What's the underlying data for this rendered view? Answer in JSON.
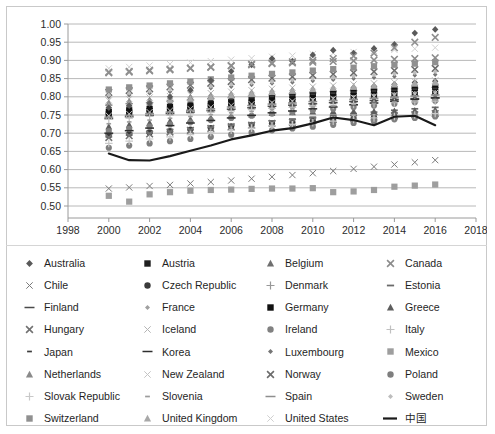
{
  "chart_data": {
    "type": "scatter",
    "title": "",
    "xlabel": "",
    "ylabel": "",
    "xlim": [
      1998,
      2018
    ],
    "ylim": [
      0.5,
      1.0
    ],
    "xticks": [
      "1998",
      "2000",
      "2002",
      "2004",
      "2006",
      "2008",
      "2010",
      "2012",
      "2014",
      "2016",
      "2018"
    ],
    "yticks": [
      "0.50",
      "0.55",
      "0.60",
      "0.65",
      "0.70",
      "0.75",
      "0.80",
      "0.85",
      "0.90",
      "0.95",
      "1.00"
    ],
    "grid": true,
    "legend_position": "bottom",
    "x": [
      2000,
      2001,
      2002,
      2003,
      2004,
      2005,
      2006,
      2007,
      2008,
      2009,
      2010,
      2011,
      2012,
      2013,
      2014,
      2015,
      2016
    ],
    "series": [
      {
        "name": "Australia",
        "marker": "diamond",
        "color": "#595959",
        "values": [
          0.755,
          0.762,
          0.768,
          0.772,
          0.778,
          0.783,
          0.789,
          0.793,
          0.8,
          0.806,
          0.812,
          0.818,
          0.824,
          0.829,
          0.834,
          0.839,
          0.843
        ]
      },
      {
        "name": "Austria",
        "marker": "square",
        "color": "#1f1f1f",
        "values": [
          0.752,
          0.757,
          0.761,
          0.765,
          0.77,
          0.774,
          0.779,
          0.783,
          0.788,
          0.792,
          0.795,
          0.799,
          0.802,
          0.805,
          0.808,
          0.81,
          0.812
        ]
      },
      {
        "name": "Belgium",
        "marker": "triangle",
        "color": "#6f6f6f",
        "values": [
          0.745,
          0.749,
          0.753,
          0.757,
          0.761,
          0.765,
          0.769,
          0.773,
          0.777,
          0.78,
          0.784,
          0.787,
          0.79,
          0.793,
          0.796,
          0.798,
          0.8
        ]
      },
      {
        "name": "Canada",
        "marker": "x",
        "color": "#8c8c8c",
        "values": [
          0.866,
          0.868,
          0.871,
          0.874,
          0.878,
          0.881,
          0.885,
          0.888,
          0.891,
          0.893,
          0.895,
          0.897,
          0.899,
          0.901,
          0.903,
          0.905,
          0.907
        ]
      },
      {
        "name": "Chile",
        "marker": "x-thin",
        "color": "#7a7a7a",
        "values": [
          0.548,
          0.551,
          0.555,
          0.558,
          0.562,
          0.566,
          0.57,
          0.575,
          0.58,
          0.585,
          0.59,
          0.596,
          0.602,
          0.608,
          0.614,
          0.62,
          0.626
        ]
      },
      {
        "name": "Czech Republic",
        "marker": "circle",
        "color": "#3a3a3a",
        "values": [
          0.694,
          0.698,
          0.702,
          0.706,
          0.71,
          0.714,
          0.719,
          0.723,
          0.727,
          0.73,
          0.734,
          0.737,
          0.74,
          0.743,
          0.746,
          0.748,
          0.75
        ]
      },
      {
        "name": "Denmark",
        "marker": "plus",
        "color": "#989898",
        "values": [
          0.777,
          0.781,
          0.784,
          0.788,
          0.791,
          0.795,
          0.798,
          0.802,
          0.805,
          0.808,
          0.811,
          0.814,
          0.817,
          0.819,
          0.822,
          0.824,
          0.826
        ]
      },
      {
        "name": "Estonia",
        "marker": "dash",
        "color": "#6a6a6a",
        "values": [
          0.69,
          0.695,
          0.7,
          0.705,
          0.71,
          0.716,
          0.722,
          0.728,
          0.734,
          0.739,
          0.744,
          0.749,
          0.754,
          0.758,
          0.763,
          0.767,
          0.771
        ]
      },
      {
        "name": "Finland",
        "marker": "dash-long",
        "color": "#4a4a4a",
        "values": [
          0.74,
          0.745,
          0.749,
          0.754,
          0.758,
          0.762,
          0.766,
          0.77,
          0.774,
          0.777,
          0.781,
          0.784,
          0.787,
          0.79,
          0.793,
          0.795,
          0.797
        ]
      },
      {
        "name": "France",
        "marker": "diamond-sm",
        "color": "#a0a0a0",
        "values": [
          0.762,
          0.766,
          0.77,
          0.773,
          0.777,
          0.781,
          0.784,
          0.788,
          0.791,
          0.794,
          0.797,
          0.8,
          0.803,
          0.805,
          0.808,
          0.81,
          0.812
        ]
      },
      {
        "name": "Germany",
        "marker": "square",
        "color": "#111111",
        "values": [
          0.758,
          0.763,
          0.767,
          0.772,
          0.776,
          0.781,
          0.786,
          0.791,
          0.796,
          0.8,
          0.805,
          0.809,
          0.813,
          0.817,
          0.821,
          0.824,
          0.827
        ]
      },
      {
        "name": "Greece",
        "marker": "triangle",
        "color": "#5d5d5d",
        "values": [
          0.718,
          0.723,
          0.728,
          0.733,
          0.738,
          0.742,
          0.747,
          0.751,
          0.755,
          0.757,
          0.759,
          0.76,
          0.76,
          0.76,
          0.761,
          0.762,
          0.764
        ]
      },
      {
        "name": "Hungary",
        "marker": "x",
        "color": "#727272",
        "values": [
          0.688,
          0.693,
          0.698,
          0.703,
          0.708,
          0.713,
          0.718,
          0.722,
          0.727,
          0.73,
          0.734,
          0.737,
          0.741,
          0.744,
          0.748,
          0.751,
          0.754
        ]
      },
      {
        "name": "Iceland",
        "marker": "x-thin",
        "color": "#b4b4b4",
        "values": [
          0.79,
          0.794,
          0.798,
          0.802,
          0.806,
          0.81,
          0.814,
          0.818,
          0.822,
          0.825,
          0.828,
          0.831,
          0.834,
          0.837,
          0.84,
          0.842,
          0.845
        ]
      },
      {
        "name": "Ireland",
        "marker": "circle",
        "color": "#818181",
        "values": [
          0.706,
          0.712,
          0.718,
          0.724,
          0.73,
          0.736,
          0.742,
          0.748,
          0.754,
          0.758,
          0.763,
          0.767,
          0.772,
          0.776,
          0.781,
          0.785,
          0.789
        ]
      },
      {
        "name": "Italy",
        "marker": "plus",
        "color": "#c0c0c0",
        "values": [
          0.738,
          0.742,
          0.746,
          0.75,
          0.754,
          0.757,
          0.761,
          0.765,
          0.768,
          0.771,
          0.774,
          0.776,
          0.779,
          0.781,
          0.784,
          0.786,
          0.788
        ]
      },
      {
        "name": "Japan",
        "marker": "dash-sm",
        "color": "#3d3d3d",
        "values": [
          0.77,
          0.774,
          0.778,
          0.782,
          0.786,
          0.79,
          0.794,
          0.798,
          0.801,
          0.804,
          0.807,
          0.81,
          0.813,
          0.816,
          0.818,
          0.821,
          0.823
        ]
      },
      {
        "name": "Korea",
        "marker": "dash-long",
        "color": "#2e2e2e",
        "values": [
          0.7,
          0.707,
          0.714,
          0.721,
          0.728,
          0.735,
          0.742,
          0.749,
          0.756,
          0.761,
          0.767,
          0.772,
          0.778,
          0.783,
          0.788,
          0.793,
          0.797
        ]
      },
      {
        "name": "Luxembourg",
        "marker": "diamond-sm",
        "color": "#757575",
        "values": [
          0.8,
          0.805,
          0.81,
          0.814,
          0.819,
          0.824,
          0.828,
          0.833,
          0.837,
          0.84,
          0.844,
          0.847,
          0.85,
          0.853,
          0.856,
          0.859,
          0.861
        ]
      },
      {
        "name": "Mexico",
        "marker": "square",
        "color": "#9e9e9e",
        "values": [
          0.528,
          0.512,
          0.532,
          0.538,
          0.542,
          0.544,
          0.545,
          0.547,
          0.548,
          0.548,
          0.549,
          0.538,
          0.54,
          0.544,
          0.553,
          0.556,
          0.559
        ]
      },
      {
        "name": "Netherlands",
        "marker": "triangle",
        "color": "#8a8a8a",
        "values": [
          0.783,
          0.787,
          0.791,
          0.795,
          0.799,
          0.803,
          0.807,
          0.811,
          0.815,
          0.818,
          0.821,
          0.824,
          0.827,
          0.83,
          0.833,
          0.835,
          0.838
        ]
      },
      {
        "name": "New Zealand",
        "marker": "x-thin",
        "color": "#c4c4c4",
        "values": [
          0.748,
          0.753,
          0.758,
          0.762,
          0.767,
          0.771,
          0.776,
          0.78,
          0.784,
          0.788,
          0.791,
          0.795,
          0.798,
          0.801,
          0.805,
          0.808,
          0.811
        ]
      },
      {
        "name": "Norway",
        "marker": "x",
        "color": "#6c6c6c",
        "values": [
          0.812,
          0.817,
          0.822,
          0.827,
          0.832,
          0.837,
          0.842,
          0.847,
          0.851,
          0.855,
          0.859,
          0.862,
          0.866,
          0.869,
          0.872,
          0.875,
          0.878
        ]
      },
      {
        "name": "Poland",
        "marker": "circle",
        "color": "#7e7e7e",
        "values": [
          0.66,
          0.666,
          0.672,
          0.678,
          0.684,
          0.69,
          0.696,
          0.702,
          0.708,
          0.713,
          0.718,
          0.723,
          0.728,
          0.733,
          0.738,
          0.742,
          0.746
        ]
      },
      {
        "name": "Slovak Republic",
        "marker": "plus",
        "color": "#c8c8c8",
        "values": [
          0.672,
          0.678,
          0.684,
          0.69,
          0.696,
          0.702,
          0.708,
          0.714,
          0.72,
          0.724,
          0.729,
          0.733,
          0.738,
          0.742,
          0.746,
          0.75,
          0.754
        ]
      },
      {
        "name": "Slovenia",
        "marker": "dash-sm",
        "color": "#9c9c9c",
        "values": [
          0.726,
          0.731,
          0.736,
          0.741,
          0.746,
          0.751,
          0.756,
          0.76,
          0.765,
          0.768,
          0.772,
          0.775,
          0.779,
          0.782,
          0.786,
          0.789,
          0.792
        ]
      },
      {
        "name": "Spain",
        "marker": "dash-long",
        "color": "#8e8e8e",
        "values": [
          0.744,
          0.749,
          0.754,
          0.758,
          0.763,
          0.767,
          0.772,
          0.776,
          0.78,
          0.783,
          0.787,
          0.79,
          0.793,
          0.796,
          0.799,
          0.802,
          0.805
        ]
      },
      {
        "name": "Sweden",
        "marker": "diamond-sm",
        "color": "#bdbdbd",
        "values": [
          0.805,
          0.81,
          0.815,
          0.82,
          0.824,
          0.829,
          0.834,
          0.838,
          0.842,
          0.846,
          0.85,
          0.853,
          0.857,
          0.86,
          0.863,
          0.866,
          0.869
        ]
      },
      {
        "name": "Switzerland",
        "marker": "square",
        "color": "#909090",
        "values": [
          0.82,
          0.826,
          0.831,
          0.837,
          0.842,
          0.848,
          0.853,
          0.858,
          0.863,
          0.867,
          0.872,
          0.876,
          0.88,
          0.884,
          0.888,
          0.891,
          0.895
        ]
      },
      {
        "name": "United Kingdom",
        "marker": "triangle",
        "color": "#a8a8a8",
        "values": [
          0.775,
          0.78,
          0.785,
          0.79,
          0.794,
          0.799,
          0.804,
          0.808,
          0.813,
          0.816,
          0.82,
          0.824,
          0.827,
          0.831,
          0.834,
          0.837,
          0.84
        ]
      },
      {
        "name": "United States",
        "marker": "x-thin",
        "color": "#d0d0d0",
        "values": [
          0.878,
          0.882,
          0.886,
          0.89,
          0.894,
          0.898,
          0.902,
          0.906,
          0.91,
          0.913,
          0.917,
          0.92,
          0.923,
          0.926,
          0.929,
          0.932,
          0.935
        ]
      },
      {
        "name": "Australia-high",
        "marker": "diamond",
        "color": "#5a5a5a",
        "hidden_legend": true,
        "values": [
          0.77,
          0.776,
          0.782,
          0.8,
          0.818,
          0.845,
          0.87,
          0.888,
          0.905,
          0.898,
          0.915,
          0.928,
          0.92,
          0.933,
          0.944,
          0.975,
          0.985
        ]
      },
      {
        "name": "Canada-high",
        "marker": "x",
        "color": "#8f8f8f",
        "hidden_legend": true,
        "values": [
          0.868,
          0.87,
          0.873,
          0.876,
          0.879,
          0.882,
          0.886,
          0.89,
          0.893,
          0.896,
          0.9,
          0.905,
          0.912,
          0.92,
          0.935,
          0.95,
          0.963
        ]
      }
    ],
    "highlight_series": {
      "name": "中国",
      "marker": "line",
      "color": "#1a1a1a",
      "values": [
        0.644,
        0.626,
        0.625,
        0.637,
        0.652,
        0.666,
        0.683,
        0.694,
        0.707,
        0.714,
        0.727,
        0.743,
        0.736,
        0.722,
        0.745,
        0.748,
        0.722
      ]
    }
  },
  "legend": {
    "items": [
      {
        "label": "Australia",
        "marker": "diamond",
        "color": "#595959"
      },
      {
        "label": "Austria",
        "marker": "square",
        "color": "#1f1f1f"
      },
      {
        "label": "Belgium",
        "marker": "triangle",
        "color": "#6f6f6f"
      },
      {
        "label": "Canada",
        "marker": "x",
        "color": "#8c8c8c"
      },
      {
        "label": "Chile",
        "marker": "x-thin",
        "color": "#7a7a7a"
      },
      {
        "label": "Czech Republic",
        "marker": "circle",
        "color": "#3a3a3a"
      },
      {
        "label": "Denmark",
        "marker": "plus",
        "color": "#989898"
      },
      {
        "label": "Estonia",
        "marker": "dash",
        "color": "#6a6a6a"
      },
      {
        "label": "Finland",
        "marker": "dash-long",
        "color": "#4a4a4a"
      },
      {
        "label": "France",
        "marker": "diamond-sm",
        "color": "#a0a0a0"
      },
      {
        "label": "Germany",
        "marker": "square",
        "color": "#111111"
      },
      {
        "label": "Greece",
        "marker": "triangle",
        "color": "#5d5d5d"
      },
      {
        "label": "Hungary",
        "marker": "x",
        "color": "#727272"
      },
      {
        "label": "Iceland",
        "marker": "x-thin",
        "color": "#b4b4b4"
      },
      {
        "label": "Ireland",
        "marker": "circle",
        "color": "#818181"
      },
      {
        "label": "Italy",
        "marker": "plus",
        "color": "#c0c0c0"
      },
      {
        "label": "Japan",
        "marker": "dash-sm",
        "color": "#3d3d3d"
      },
      {
        "label": "Korea",
        "marker": "dash-long",
        "color": "#2e2e2e"
      },
      {
        "label": "Luxembourg",
        "marker": "diamond-sm",
        "color": "#757575"
      },
      {
        "label": "Mexico",
        "marker": "square",
        "color": "#9e9e9e"
      },
      {
        "label": "Netherlands",
        "marker": "triangle",
        "color": "#8a8a8a"
      },
      {
        "label": "New Zealand",
        "marker": "x-thin",
        "color": "#c4c4c4"
      },
      {
        "label": "Norway",
        "marker": "x",
        "color": "#6c6c6c"
      },
      {
        "label": "Poland",
        "marker": "circle",
        "color": "#7e7e7e"
      },
      {
        "label": "Slovak Republic",
        "marker": "plus",
        "color": "#c8c8c8"
      },
      {
        "label": "Slovenia",
        "marker": "dash-sm",
        "color": "#9c9c9c"
      },
      {
        "label": "Spain",
        "marker": "dash-long",
        "color": "#8e8e8e"
      },
      {
        "label": "Sweden",
        "marker": "diamond-sm",
        "color": "#bdbdbd"
      },
      {
        "label": "Switzerland",
        "marker": "square",
        "color": "#909090"
      },
      {
        "label": "United Kingdom",
        "marker": "triangle",
        "color": "#a8a8a8"
      },
      {
        "label": "United States",
        "marker": "x-thin",
        "color": "#d0d0d0"
      },
      {
        "label": "中国",
        "marker": "line",
        "color": "#1a1a1a"
      }
    ]
  }
}
